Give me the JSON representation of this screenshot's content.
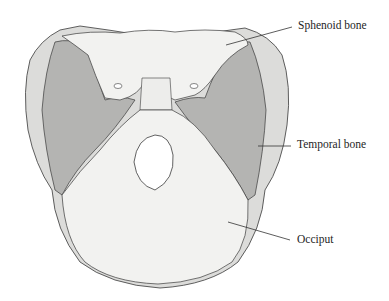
{
  "figure": {
    "labels": [
      {
        "id": "sphenoid",
        "text": "Sphenoid bone"
      },
      {
        "id": "temporal",
        "text": "Temporal bone"
      },
      {
        "id": "occiput",
        "text": "Occiput"
      }
    ]
  },
  "colors": {
    "bone_light": "#f2f2f0",
    "bone_shaded": "#b4b4b2",
    "bone_edge": "#dcdcda",
    "outline": "#3a3a3a",
    "leader": "#333333"
  }
}
